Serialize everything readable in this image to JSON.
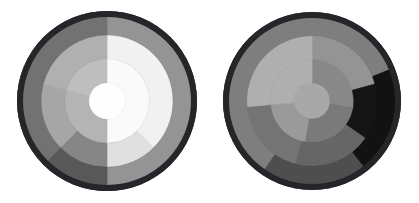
{
  "figure": {
    "title": "",
    "background_color": "#ffffff",
    "width": 419,
    "height": 203,
    "panel_count": 2
  },
  "chart_data": {
    "type": "pie",
    "subtype": "nested-polar-sector-grayscale",
    "title": "",
    "subtitle": "",
    "xlabel": "",
    "ylabel": "",
    "grid": false,
    "legend": false,
    "legend_position": "none",
    "ring_radii_fraction": [
      0.0,
      0.3,
      0.6,
      0.86,
      1.0
    ],
    "ring_names": [
      "core",
      "inner",
      "middle",
      "outer",
      "rim"
    ],
    "panels": [
      {
        "name": "left-polar-diagram",
        "center_x": 107,
        "center_y": 101,
        "radius": 90,
        "rim_color": "#26262a",
        "rim_width": 6,
        "sectors": [
          {
            "ring": "core",
            "r_inner": 0.0,
            "r_outer": 0.205,
            "start_deg": 0,
            "end_deg": 360,
            "value": 0.99,
            "color": "#fefefe"
          },
          {
            "ring": "inner",
            "r_inner": 0.205,
            "r_outer": 0.47,
            "start_deg": 0,
            "end_deg": 180,
            "value": 0.98,
            "color": "#fafafa"
          },
          {
            "ring": "inner",
            "r_inner": 0.205,
            "r_outer": 0.47,
            "start_deg": 180,
            "end_deg": 285,
            "value": 0.72,
            "color": "#b4b4b4"
          },
          {
            "ring": "inner",
            "r_inner": 0.205,
            "r_outer": 0.47,
            "start_deg": 285,
            "end_deg": 360,
            "value": 0.76,
            "color": "#bebebe"
          },
          {
            "ring": "middle",
            "r_inner": 0.47,
            "r_outer": 0.735,
            "start_deg": 0,
            "end_deg": 135,
            "value": 0.95,
            "color": "#f1f1f1"
          },
          {
            "ring": "middle",
            "r_inner": 0.47,
            "r_outer": 0.735,
            "start_deg": 135,
            "end_deg": 180,
            "value": 0.88,
            "color": "#e0e0e0"
          },
          {
            "ring": "middle",
            "r_inner": 0.47,
            "r_outer": 0.735,
            "start_deg": 180,
            "end_deg": 225,
            "value": 0.52,
            "color": "#868686"
          },
          {
            "ring": "middle",
            "r_inner": 0.47,
            "r_outer": 0.735,
            "start_deg": 225,
            "end_deg": 285,
            "value": 0.66,
            "color": "#a6a6a6"
          },
          {
            "ring": "middle",
            "r_inner": 0.47,
            "r_outer": 0.735,
            "start_deg": 285,
            "end_deg": 360,
            "value": 0.7,
            "color": "#b0b0b0"
          },
          {
            "ring": "outer",
            "r_inner": 0.735,
            "r_outer": 0.945,
            "start_deg": 0,
            "end_deg": 180,
            "value": 0.58,
            "color": "#949494"
          },
          {
            "ring": "outer",
            "r_inner": 0.735,
            "r_outer": 0.945,
            "start_deg": 180,
            "end_deg": 225,
            "value": 0.33,
            "color": "#585858"
          },
          {
            "ring": "outer",
            "r_inner": 0.735,
            "r_outer": 0.945,
            "start_deg": 225,
            "end_deg": 360,
            "value": 0.44,
            "color": "#727272"
          }
        ]
      },
      {
        "name": "right-polar-diagram",
        "center_x": 312,
        "center_y": 101,
        "radius": 89,
        "rim_color": "#26262a",
        "rim_width": 6,
        "sectors": [
          {
            "ring": "core",
            "r_inner": 0.0,
            "r_outer": 0.205,
            "start_deg": 0,
            "end_deg": 360,
            "value": 0.66,
            "color": "#a8a8a8"
          },
          {
            "ring": "inner",
            "r_inner": 0.205,
            "r_outer": 0.47,
            "start_deg": 0,
            "end_deg": 100,
            "value": 0.53,
            "color": "#888888"
          },
          {
            "ring": "inner",
            "r_inner": 0.205,
            "r_outer": 0.47,
            "start_deg": 100,
            "end_deg": 190,
            "value": 0.47,
            "color": "#7a7a7a"
          },
          {
            "ring": "inner",
            "r_inner": 0.205,
            "r_outer": 0.47,
            "start_deg": 190,
            "end_deg": 265,
            "value": 0.6,
            "color": "#9a9a9a"
          },
          {
            "ring": "inner",
            "r_inner": 0.205,
            "r_outer": 0.47,
            "start_deg": 265,
            "end_deg": 360,
            "value": 0.69,
            "color": "#afafaf"
          },
          {
            "ring": "middle",
            "r_inner": 0.47,
            "r_outer": 0.735,
            "start_deg": 0,
            "end_deg": 75,
            "value": 0.58,
            "color": "#949494"
          },
          {
            "ring": "middle",
            "r_inner": 0.47,
            "r_outer": 0.735,
            "start_deg": 75,
            "end_deg": 125,
            "value": 0.08,
            "color": "#151515"
          },
          {
            "ring": "middle",
            "r_inner": 0.47,
            "r_outer": 0.735,
            "start_deg": 125,
            "end_deg": 195,
            "value": 0.39,
            "color": "#666666"
          },
          {
            "ring": "middle",
            "r_inner": 0.47,
            "r_outer": 0.735,
            "start_deg": 195,
            "end_deg": 265,
            "value": 0.45,
            "color": "#747474"
          },
          {
            "ring": "middle",
            "r_inner": 0.47,
            "r_outer": 0.735,
            "start_deg": 265,
            "end_deg": 360,
            "value": 0.69,
            "color": "#afafaf"
          },
          {
            "ring": "outer",
            "r_inner": 0.735,
            "r_outer": 0.945,
            "start_deg": 0,
            "end_deg": 68,
            "value": 0.49,
            "color": "#7e7e7e"
          },
          {
            "ring": "outer",
            "r_inner": 0.735,
            "r_outer": 0.945,
            "start_deg": 68,
            "end_deg": 142,
            "value": 0.07,
            "color": "#121212"
          },
          {
            "ring": "outer",
            "r_inner": 0.735,
            "r_outer": 0.945,
            "start_deg": 142,
            "end_deg": 215,
            "value": 0.29,
            "color": "#4e4e4e"
          },
          {
            "ring": "outer",
            "r_inner": 0.735,
            "r_outer": 0.945,
            "start_deg": 215,
            "end_deg": 360,
            "value": 0.49,
            "color": "#7e7e7e"
          }
        ]
      }
    ]
  }
}
